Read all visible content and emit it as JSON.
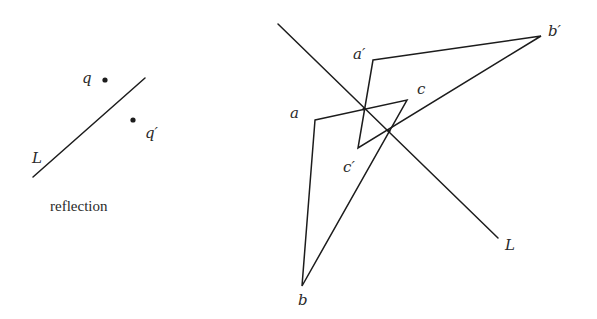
{
  "left_figure": {
    "line_label": "L",
    "point_label": "q",
    "reflected_point_label": "q′",
    "caption": "reflection"
  },
  "right_figure": {
    "line_label": "L",
    "vertices": {
      "a": "a",
      "b": "b",
      "c": "c",
      "a_prime": "a′",
      "b_prime": "b′",
      "c_prime": "c′"
    }
  },
  "colors": {
    "stroke": "#1c1c1c",
    "text": "#2a2a2a",
    "background": "#ffffff"
  }
}
